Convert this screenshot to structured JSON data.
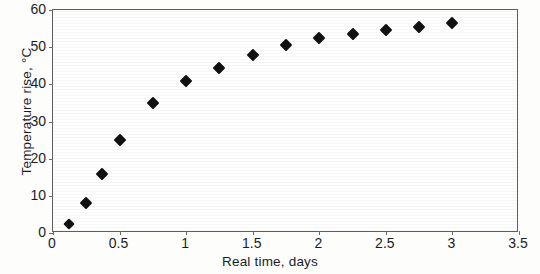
{
  "chart_data": {
    "type": "scatter",
    "title": "",
    "xlabel": "Real time, days",
    "ylabel": "Temperature rise, °C",
    "xlim": [
      0,
      3.5
    ],
    "ylim": [
      0,
      60
    ],
    "xticks": [
      "0",
      "0.5",
      "1",
      "1.5",
      "2",
      "2.5",
      "3",
      "3.5"
    ],
    "xtick_values": [
      0,
      0.5,
      1,
      1.5,
      2,
      2.5,
      3,
      3.5
    ],
    "yticks": [
      "0",
      "10",
      "20",
      "30",
      "40",
      "50",
      "60"
    ],
    "ytick_values": [
      0,
      10,
      20,
      30,
      40,
      50,
      60
    ],
    "grid": false,
    "legend": "none",
    "marker": "filled-diamond",
    "marker_color": "#111111",
    "x": [
      0.12,
      0.25,
      0.37,
      0.5,
      0.75,
      1.0,
      1.25,
      1.5,
      1.75,
      2.0,
      2.25,
      2.5,
      2.75,
      3.0
    ],
    "y": [
      2.5,
      8.0,
      16.0,
      25.0,
      35.0,
      41.0,
      44.5,
      48.0,
      50.5,
      52.5,
      53.5,
      54.5,
      55.5,
      56.5
    ],
    "points": [
      {
        "x": 0.12,
        "y": 2.5
      },
      {
        "x": 0.25,
        "y": 8.0
      },
      {
        "x": 0.37,
        "y": 16.0
      },
      {
        "x": 0.5,
        "y": 25.0
      },
      {
        "x": 0.75,
        "y": 35.0
      },
      {
        "x": 1.0,
        "y": 41.0
      },
      {
        "x": 1.25,
        "y": 44.5
      },
      {
        "x": 1.5,
        "y": 48.0
      },
      {
        "x": 1.75,
        "y": 50.5
      },
      {
        "x": 2.0,
        "y": 52.5
      },
      {
        "x": 2.25,
        "y": 53.5
      },
      {
        "x": 2.5,
        "y": 54.5
      },
      {
        "x": 2.75,
        "y": 55.5
      },
      {
        "x": 3.0,
        "y": 56.5
      }
    ]
  },
  "axis": {
    "y_title": "Temperature rise, °C",
    "x_title": "Real time, days"
  }
}
